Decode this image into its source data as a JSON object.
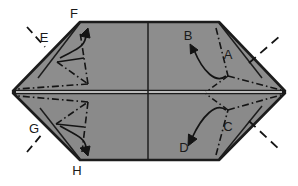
{
  "figure": {
    "type": "origami-folding-diagram",
    "canvas": {
      "width": 298,
      "height": 186
    },
    "colors": {
      "paper_fill": "#8c8c8c",
      "paper_fill_lower": "#8a8a8a",
      "outline": "#1c1c1c",
      "crease_line": "#141414",
      "arrow": "#141414",
      "label_text": "#1a1a1a",
      "background": "#ffffff",
      "midline_gap": "#f2f2f2"
    },
    "outline": {
      "shape": "hexagon",
      "vertices": [
        {
          "name": "left-vertex",
          "x": 13,
          "y": 92
        },
        {
          "name": "top-left-corner",
          "x": 80,
          "y": 22
        },
        {
          "name": "top-right-corner",
          "x": 219,
          "y": 22
        },
        {
          "name": "right-vertex",
          "x": 285,
          "y": 92
        },
        {
          "name": "bottom-right-corner",
          "x": 219,
          "y": 160
        },
        {
          "name": "bottom-left-corner",
          "x": 80,
          "y": 160
        }
      ]
    },
    "guides": {
      "center_vertical_x": 148,
      "horizontal_midline_y": 92
    }
  },
  "labels": [
    {
      "id": "A",
      "text": "A",
      "x": 228,
      "y": 59,
      "note": "upper-right flap point"
    },
    {
      "id": "B",
      "text": "B",
      "x": 188,
      "y": 40,
      "note": "upper-right arrow target"
    },
    {
      "id": "C",
      "text": "C",
      "x": 228,
      "y": 131,
      "note": "lower-right flap point"
    },
    {
      "id": "D",
      "text": "D",
      "x": 184,
      "y": 152,
      "note": "lower-right arrow target"
    },
    {
      "id": "E",
      "text": "E",
      "x": 44,
      "y": 42,
      "note": "upper-left flap point"
    },
    {
      "id": "F",
      "text": "F",
      "x": 74,
      "y": 18,
      "note": "upper-left arrow target"
    },
    {
      "id": "G",
      "text": "G",
      "x": 34,
      "y": 133,
      "note": "lower-left flap point"
    },
    {
      "id": "H",
      "text": "H",
      "x": 77,
      "y": 175,
      "note": "lower-left arrow target"
    }
  ],
  "arrows": [
    {
      "id": "arrow-to-B",
      "from": [
        226,
        74
      ],
      "to": [
        192,
        46
      ],
      "style": "curved-solid",
      "head": "open"
    },
    {
      "id": "arrow-to-D",
      "from": [
        226,
        112
      ],
      "to": [
        190,
        144
      ],
      "style": "curved-solid",
      "head": "open"
    },
    {
      "id": "arrow-to-F",
      "from": [
        66,
        52
      ],
      "to": [
        86,
        32
      ],
      "style": "curved-solid",
      "head": "open"
    },
    {
      "id": "arrow-to-H",
      "from": [
        66,
        134
      ],
      "to": [
        84,
        152
      ],
      "style": "curved-solid",
      "head": "open"
    }
  ],
  "creases": {
    "style": "dash-dot",
    "description": "dash-dot fold/crease lines forming small triangular flap patterns inside each of the four quadrant corners, plus short dashes extending outside the hexagon at E, G and the right vertex"
  },
  "external_dashes": [
    {
      "id": "dash-upper-right",
      "from": [
        250,
        63
      ],
      "to": [
        280,
        36
      ]
    },
    {
      "id": "dash-lower-right",
      "from": [
        250,
        121
      ],
      "to": [
        280,
        150
      ]
    },
    {
      "id": "dash-upper-left",
      "from": [
        26,
        28
      ],
      "to": [
        44,
        47
      ]
    },
    {
      "id": "dash-lower-left",
      "from": [
        26,
        150
      ],
      "to": [
        42,
        132
      ]
    }
  ]
}
